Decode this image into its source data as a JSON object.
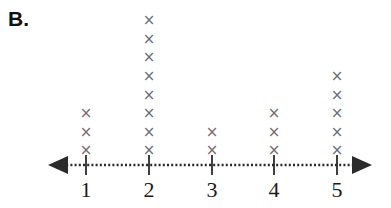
{
  "panel": {
    "label": "B."
  },
  "chart_data": {
    "type": "bar",
    "subtype": "dot-plot",
    "title": "B.",
    "xlabel": "",
    "ylabel": "",
    "categories": [
      "1",
      "2",
      "3",
      "4",
      "5"
    ],
    "values": [
      3,
      8,
      2,
      3,
      5
    ],
    "mark_glyph": "×",
    "mark_color": "#6e6e73",
    "axis_color": "#2b2b2b",
    "axis_style": "dotted-with-double-arrows",
    "grid": false,
    "legend": null,
    "xlim": [
      0.5,
      5.5
    ],
    "ylim": [
      0,
      8
    ],
    "annotations": []
  },
  "axis": {
    "left_arrow_icon": "left-arrow-icon",
    "right_arrow_icon": "right-arrow-icon",
    "ticks": [
      {
        "label": "1",
        "count": 3
      },
      {
        "label": "2",
        "count": 8
      },
      {
        "label": "3",
        "count": 2
      },
      {
        "label": "4",
        "count": 3
      },
      {
        "label": "5",
        "count": 5
      }
    ]
  },
  "geometry": {
    "axis_y": 165,
    "tick_x": [
      86,
      149,
      212,
      274,
      337
    ],
    "line_start_x": 50,
    "line_end_x": 370
  }
}
